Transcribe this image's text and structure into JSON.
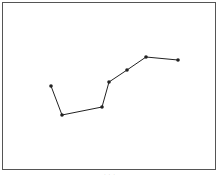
{
  "chart_data": {
    "type": "line",
    "title": "",
    "xlabel": "",
    "ylabel": "",
    "grid": false,
    "legend": null,
    "points_px": [
      [
        51,
        86
      ],
      [
        62,
        115
      ],
      [
        102,
        107
      ],
      [
        109,
        82
      ],
      [
        127,
        70
      ],
      [
        146,
        57
      ],
      [
        178,
        60
      ]
    ],
    "x": [
      1,
      2,
      3,
      4,
      5,
      6,
      7
    ],
    "values": [
      58,
      42,
      46,
      60,
      67,
      74,
      72
    ],
    "marker": "circle",
    "line_color": "#222222"
  },
  "caption": "· · ·"
}
